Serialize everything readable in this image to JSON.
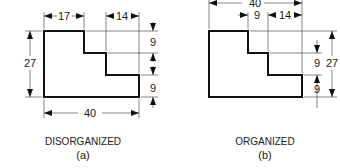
{
  "figures": [
    {
      "id": "a",
      "caption": "DISORGANIZED",
      "sublabel": "(a)",
      "dimensions": {
        "top_left": "17",
        "top_right": "14",
        "height": "27",
        "width": "40",
        "right_upper": "9",
        "right_lower": "9"
      }
    },
    {
      "id": "b",
      "caption": "ORGANIZED",
      "sublabel": "(b)",
      "dimensions": {
        "width": "40",
        "step_a": "9",
        "step_b": "14",
        "right_upper": "9",
        "right_lower": "9",
        "height": "27"
      }
    }
  ],
  "colors": {
    "line": "#111111"
  }
}
